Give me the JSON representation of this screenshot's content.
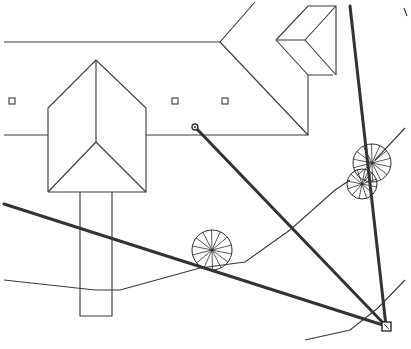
{
  "drawing": {
    "width": 411,
    "height": 349,
    "background": "#ffffff",
    "line_color": "#3a3a3a",
    "roof_lines": [
      {
        "name": "ridge-top-left",
        "points": "4,42 220,42 255,2"
      },
      {
        "name": "roof-diagonal-main",
        "points": "220,42 308,135"
      },
      {
        "name": "eave-line",
        "points": "4,135 48,135"
      },
      {
        "name": "eave-line-mid",
        "points": "146,135 308,135 308,75 333,75"
      },
      {
        "name": "dormer-top",
        "points": "276,40 308,6 336,6 336,75"
      },
      {
        "name": "dormer-valley",
        "points": "276,40 305,40 336,6"
      },
      {
        "name": "dormer-lower",
        "points": "276,40 308,75"
      },
      {
        "name": "dormer-lower-2",
        "points": "305,40 336,75"
      },
      {
        "name": "gable-outline",
        "points": "48,192 48,108 96,60 146,108 146,192 48,192"
      },
      {
        "name": "gable-ridge",
        "points": "96,60 96,142"
      },
      {
        "name": "gable-hip-left",
        "points": "48,192 96,142"
      },
      {
        "name": "gable-hip-right",
        "points": "146,192 96,142"
      },
      {
        "name": "walkway",
        "points": "80,192 80,316 112,316 112,192"
      },
      {
        "name": "path-curve",
        "points": "4,280 95,290 120,290 200,268 245,262 290,230 335,190 350,180"
      },
      {
        "name": "path-curve-bottom",
        "points": "305,340 350,330 378,308 405,280"
      },
      {
        "name": "path-curve-right",
        "points": "375,160 405,128"
      },
      {
        "name": "arc-top-right",
        "points": "404,8 407,16"
      }
    ],
    "windows": [
      {
        "x": 9,
        "y": 98,
        "size": 6
      },
      {
        "x": 172,
        "y": 98,
        "size": 6
      },
      {
        "x": 222,
        "y": 98,
        "size": 6
      }
    ],
    "sight_lines": [
      {
        "name": "sight-line-from-house",
        "x1": 195,
        "y1": 127,
        "x2": 386,
        "y2": 326
      },
      {
        "name": "sight-line-left",
        "x1": 4,
        "y1": 204,
        "x2": 386,
        "y2": 326
      },
      {
        "name": "sight-line-vertical",
        "x1": 350,
        "y1": 6,
        "x2": 386,
        "y2": 326
      }
    ],
    "trees": [
      {
        "name": "tree-center",
        "cx": 212,
        "cy": 250,
        "r": 20,
        "spokes": 14
      },
      {
        "name": "tree-right-upper",
        "cx": 372,
        "cy": 163,
        "r": 19,
        "spokes": 14
      },
      {
        "name": "tree-right-lower",
        "cx": 362,
        "cy": 184,
        "r": 15,
        "spokes": 12
      }
    ],
    "markers": [
      {
        "name": "viewpoint-marker",
        "type": "circle",
        "x": 195,
        "y": 127,
        "r": 3
      },
      {
        "name": "target-marker",
        "type": "square",
        "x": 382,
        "y": 322,
        "size": 9
      }
    ]
  }
}
